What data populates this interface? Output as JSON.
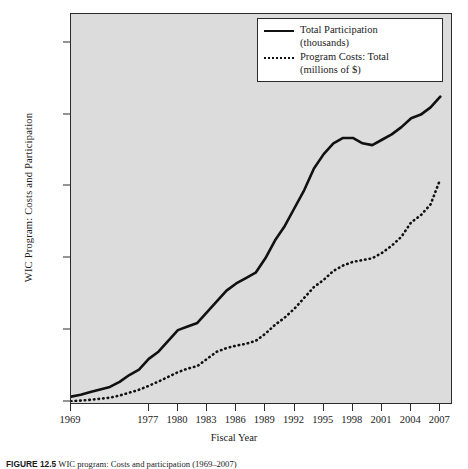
{
  "figure": {
    "caption_label": "FIGURE 12.5",
    "caption_text": "WIC program: Costs and participation (1969–2007)",
    "background_color": "#ffffff",
    "plot_background_color": "#dcdcdc",
    "frame_color": "#2b2b2b"
  },
  "legend": {
    "position": "top-right",
    "items": [
      {
        "style": "solid",
        "label_line1": "Total Participation",
        "label_line2": "(thousands)"
      },
      {
        "style": "dotted",
        "label_line1": "Program Costs: Total",
        "label_line2": "(millions of $)"
      }
    ]
  },
  "chart_data": {
    "type": "line",
    "title": "",
    "xlabel": "Fiscal Year",
    "ylabel": "WIC Program: Costs and Participation",
    "xlim": [
      1969,
      2008
    ],
    "ylim": [
      0,
      10800
    ],
    "grid": false,
    "legend_position": "top-right",
    "ytick_labels": [
      "0",
      "2,000",
      "4,000",
      "6,000",
      "8,000",
      "10,000"
    ],
    "ytick_values": [
      0,
      2000,
      4000,
      6000,
      8000,
      10000
    ],
    "xtick_labels": [
      "1969",
      "1977",
      "1980",
      "1983",
      "1986",
      "1989",
      "1992",
      "1995",
      "1998",
      "2001",
      "2004",
      "2007"
    ],
    "xtick_values": [
      1969,
      1977,
      1980,
      1983,
      1986,
      1989,
      1992,
      1995,
      1998,
      2001,
      2004,
      2007
    ],
    "x": [
      1969,
      1970,
      1971,
      1972,
      1973,
      1974,
      1975,
      1976,
      1977,
      1978,
      1979,
      1980,
      1981,
      1982,
      1983,
      1984,
      1985,
      1986,
      1987,
      1988,
      1989,
      1990,
      1991,
      1992,
      1993,
      1994,
      1995,
      1996,
      1997,
      1998,
      1999,
      2000,
      2001,
      2002,
      2003,
      2004,
      2005,
      2006,
      2007
    ],
    "series": [
      {
        "name": "Total Participation (thousands)",
        "style": "solid",
        "color": "#111111",
        "values": [
          150,
          200,
          280,
          350,
          420,
          560,
          750,
          900,
          1200,
          1400,
          1700,
          2000,
          2100,
          2200,
          2500,
          2800,
          3100,
          3300,
          3450,
          3600,
          4000,
          4500,
          4900,
          5400,
          5900,
          6500,
          6900,
          7200,
          7350,
          7350,
          7200,
          7150,
          7300,
          7450,
          7650,
          7900,
          8000,
          8200,
          8500
        ]
      },
      {
        "name": "Program Costs: Total (millions of $)",
        "style": "dotted",
        "color": "#111111",
        "values": [
          20,
          40,
          60,
          90,
          120,
          180,
          260,
          340,
          450,
          570,
          700,
          830,
          930,
          1000,
          1200,
          1400,
          1500,
          1570,
          1620,
          1700,
          1900,
          2150,
          2350,
          2600,
          2900,
          3200,
          3400,
          3650,
          3800,
          3900,
          3950,
          4000,
          4150,
          4350,
          4600,
          5000,
          5200,
          5500,
          6200
        ]
      }
    ],
    "annotations": []
  },
  "axes": {
    "y_title": "WIC Program: Costs and Participation",
    "x_title": "Fiscal Year"
  }
}
